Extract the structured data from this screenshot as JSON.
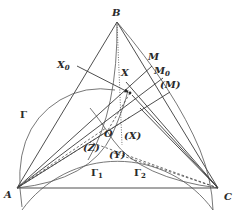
{
  "figure": {
    "type": "geometry-diagram",
    "background": "#ffffff",
    "stroke_color": "#3a3a3a"
  },
  "points": {
    "A": {
      "label": "A",
      "x": 17,
      "y": 188
    },
    "B": {
      "label": "B",
      "x": 117,
      "y": 22
    },
    "C": {
      "label": "C",
      "x": 218,
      "y": 188
    },
    "P": {
      "label": "",
      "x": 130,
      "y": 93
    },
    "O": {
      "label": "O",
      "x": 108,
      "y": 128
    }
  },
  "labels": {
    "B": "B",
    "X0": "X",
    "X0_sub": "0",
    "M": "M",
    "X": "X",
    "M0": "M",
    "M0_sub": "0",
    "M_paren": "(M)",
    "Gamma": "Γ",
    "O": "O",
    "X_paren": "(X)",
    "Z_paren": "(Z)",
    "Y_paren": "(Y)",
    "Gamma1": "Γ",
    "Gamma1_sub": "1",
    "Gamma2": "Γ",
    "Gamma2_sub": "2",
    "A": "A",
    "C": "C"
  }
}
